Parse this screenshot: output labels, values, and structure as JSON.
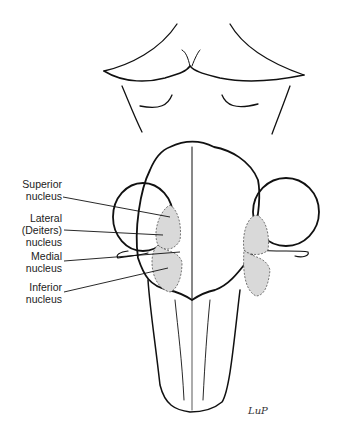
{
  "figure": {
    "colors": {
      "line": "#111111",
      "nucleus_fill": "#d9d9d9",
      "background": "#ffffff"
    },
    "labels": [
      {
        "id": "superior",
        "line1": "Superior",
        "line2": "nucleus",
        "line3": ""
      },
      {
        "id": "lateral",
        "line1": "Lateral",
        "line2": "(Deiters)",
        "line3": "nucleus"
      },
      {
        "id": "medial",
        "line1": "Medial",
        "line2": "nucleus",
        "line3": ""
      },
      {
        "id": "inferior",
        "line1": "Inferior",
        "line2": "nucleus",
        "line3": ""
      }
    ],
    "signature": "LuP"
  }
}
